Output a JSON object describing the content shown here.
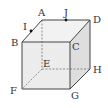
{
  "diagram": {
    "type": "cube",
    "colors": {
      "edge": "#444444",
      "hidden_edge": "#777777",
      "front_face": "#ececec",
      "top_face": "#f2f2f2",
      "side_face": "#dedede",
      "point": "#111111"
    },
    "vertices": {
      "A": {
        "label": "A",
        "x": 42,
        "y": 20,
        "lx": 37,
        "ly": 17
      },
      "D": {
        "label": "D",
        "x": 90,
        "y": 20,
        "lx": 93,
        "ly": 22
      },
      "B": {
        "label": "B",
        "x": 22,
        "y": 42,
        "lx": 10,
        "ly": 46
      },
      "C": {
        "label": "C",
        "x": 70,
        "y": 42,
        "lx": 72,
        "ly": 50
      },
      "E": {
        "label": "E",
        "x": 42,
        "y": 69,
        "lx": 42,
        "ly": 67
      },
      "H": {
        "label": "H",
        "x": 90,
        "y": 69,
        "lx": 93,
        "ly": 73
      },
      "F": {
        "label": "F",
        "x": 22,
        "y": 89,
        "lx": 9,
        "ly": 95
      },
      "G": {
        "label": "G",
        "x": 70,
        "y": 89,
        "lx": 70,
        "ly": 99
      }
    },
    "points": {
      "I": {
        "label": "I",
        "x": 31,
        "y": 31,
        "lx": 22,
        "ly": 30
      },
      "J": {
        "label": "J",
        "x": 66,
        "y": 21,
        "lx": 63,
        "ly": 17
      }
    }
  }
}
